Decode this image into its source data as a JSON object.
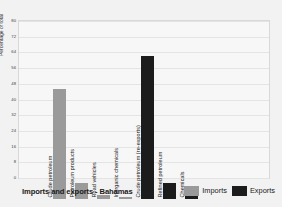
{
  "chart_data": {
    "type": "bar",
    "title": "Imports and exports - Bahamas",
    "xlabel": "",
    "ylabel": "Percentage of total",
    "ylim": [
      0,
      80
    ],
    "yticks": [
      0,
      8,
      16,
      24,
      32,
      40,
      48,
      56,
      64,
      72,
      80
    ],
    "grid": true,
    "legend_position": "bottom-right",
    "categories": [
      "Crude petroleum",
      "Petroleum products",
      "Road vehicles",
      "Inorganic chemicals",
      "Crude petroleum (re-exports)",
      "Refined petroleum",
      "Chemicals"
    ],
    "series": [
      {
        "name": "Imports",
        "color": "#9a9a9a",
        "values": [
          56,
          8,
          2,
          1,
          null,
          null,
          null
        ]
      },
      {
        "name": "Exports",
        "color": "#1c1c1c",
        "values": [
          null,
          null,
          null,
          null,
          73,
          8,
          6
        ]
      }
    ],
    "bars": [
      {
        "label": "Crude petroleum",
        "value": 56,
        "series": "Imports"
      },
      {
        "label": "Petroleum products",
        "value": 8,
        "series": "Imports"
      },
      {
        "label": "Road vehicles",
        "value": 2,
        "series": "Imports"
      },
      {
        "label": "Inorganic chemicals",
        "value": 1,
        "series": "Imports"
      },
      {
        "label": "Crude petroleum (re-exports)",
        "value": 73,
        "series": "Exports"
      },
      {
        "label": "Refined petroleum",
        "value": 8,
        "series": "Exports"
      },
      {
        "label": "Chemicals",
        "value": 6,
        "series": "Exports"
      }
    ]
  },
  "legend": {
    "imports_label": "Imports",
    "exports_label": "Exports"
  }
}
